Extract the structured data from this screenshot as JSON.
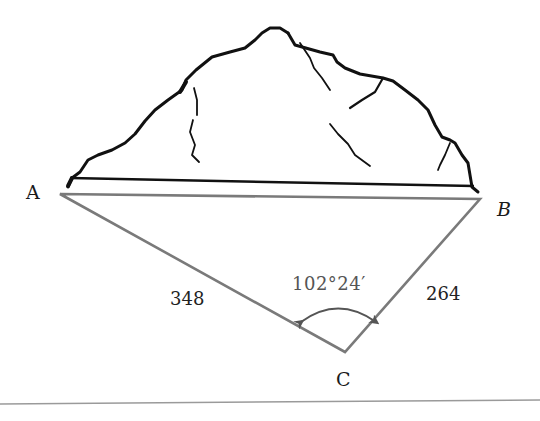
{
  "diagram": {
    "type": "surveying-triangle",
    "vertices": {
      "A": {
        "label": "A"
      },
      "B": {
        "label": "B"
      },
      "C": {
        "label": "C"
      }
    },
    "sides": {
      "AC": {
        "label": "348"
      },
      "BC": {
        "label": "264"
      }
    },
    "angle_C": {
      "label": "102°24′"
    },
    "colors": {
      "triangle": "#7a7a7a",
      "mountain": "#111111",
      "baseline": "#111111",
      "footer_rule": "#9a9a9a"
    }
  }
}
